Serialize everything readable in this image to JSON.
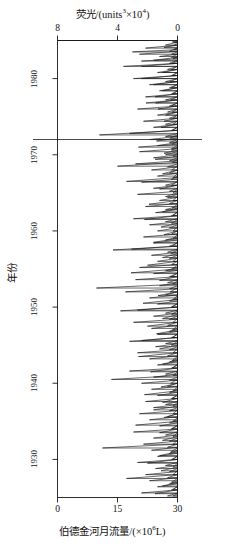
{
  "figure": {
    "kind": "dual-trace-time-series",
    "background_color": "#ffffff",
    "line_color": "#1a1a1a",
    "axis_color": "#1a1a1a"
  },
  "top_axis": {
    "title_main": "荧光/(units",
    "title_sup1": "3",
    "title_mid": "×10",
    "title_sup2": "4",
    "title_end": ")",
    "title_full": "荧光/(units³×10⁴)",
    "ticks": [
      "8",
      "4",
      "0"
    ],
    "range": [
      8,
      0
    ],
    "direction": "reversed"
  },
  "bottom_axis": {
    "title_main": "伯德金河月流量/(×10",
    "title_sup": "6",
    "title_end": "L)",
    "title_full": "伯德金河月流量/(×10⁶L)",
    "ticks": [
      "0",
      "15",
      "30"
    ],
    "range": [
      0,
      30
    ],
    "direction": "normal"
  },
  "y_axis": {
    "title": "年份",
    "ticks": [
      "1980",
      "1970",
      "1960",
      "1950",
      "1940",
      "1930"
    ],
    "range": [
      1985,
      1925
    ]
  },
  "annotations": {
    "marker_line_year": "1972"
  },
  "chart_data": {
    "type": "line",
    "xlabel": "伯德金河月流量/(×10⁶L)",
    "ylabel": "年份",
    "orientation": "horizontal-spikes-vertical-time",
    "grid": false,
    "legend": null,
    "ylim": [
      1925,
      1985
    ],
    "series": [
      {
        "name": "荧光",
        "axis": "top",
        "xlim": [
          8,
          0
        ],
        "baseline": 0,
        "units": "units³×10⁴",
        "points": [
          [
            1984.8,
            0.35
          ],
          [
            1984.4,
            0.2
          ],
          [
            1984.1,
            0.9
          ],
          [
            1983.8,
            0.25
          ],
          [
            1983.5,
            3.0
          ],
          [
            1983.2,
            0.4
          ],
          [
            1982.9,
            1.2
          ],
          [
            1982.6,
            0.3
          ],
          [
            1982.3,
            2.4
          ],
          [
            1982.0,
            0.35
          ],
          [
            1981.6,
            3.6
          ],
          [
            1981.2,
            0.4
          ],
          [
            1980.8,
            1.0
          ],
          [
            1980.4,
            0.3
          ],
          [
            1980.0,
            2.4
          ],
          [
            1979.6,
            0.5
          ],
          [
            1979.2,
            1.6
          ],
          [
            1978.8,
            0.4
          ],
          [
            1978.4,
            1.0
          ],
          [
            1978.0,
            0.3
          ],
          [
            1977.6,
            1.5
          ],
          [
            1977.2,
            0.45
          ],
          [
            1976.8,
            2.1
          ],
          [
            1976.4,
            0.4
          ],
          [
            1976.0,
            1.3
          ],
          [
            1975.6,
            0.35
          ],
          [
            1975.2,
            0.8
          ],
          [
            1974.8,
            0.3
          ],
          [
            1974.4,
            0.9
          ],
          [
            1974.0,
            0.3
          ],
          [
            1973.6,
            1.1
          ],
          [
            1973.2,
            0.35
          ],
          [
            1972.6,
            5.2
          ],
          [
            1972.2,
            0.5
          ],
          [
            1971.8,
            1.4
          ],
          [
            1971.4,
            0.35
          ],
          [
            1971.0,
            2.6
          ],
          [
            1970.6,
            0.4
          ],
          [
            1970.2,
            0.9
          ],
          [
            1969.8,
            0.3
          ],
          [
            1969.4,
            1.5
          ],
          [
            1969.0,
            0.35
          ],
          [
            1968.5,
            4.0
          ],
          [
            1968.0,
            0.4
          ],
          [
            1967.5,
            1.0
          ],
          [
            1967.0,
            0.3
          ],
          [
            1966.5,
            3.4
          ],
          [
            1966.0,
            0.4
          ],
          [
            1965.5,
            1.2
          ],
          [
            1965.0,
            0.3
          ],
          [
            1964.5,
            0.8
          ],
          [
            1964.0,
            0.3
          ],
          [
            1963.5,
            1.9
          ],
          [
            1963.0,
            0.35
          ],
          [
            1962.5,
            1.0
          ],
          [
            1962.0,
            0.3
          ],
          [
            1961.5,
            2.2
          ],
          [
            1961.0,
            0.4
          ],
          [
            1960.5,
            1.1
          ],
          [
            1960.0,
            0.3
          ],
          [
            1959.5,
            0.9
          ],
          [
            1959.0,
            0.3
          ],
          [
            1958.5,
            1.6
          ],
          [
            1958.0,
            0.35
          ],
          [
            1957.5,
            4.3
          ],
          [
            1957.0,
            0.45
          ],
          [
            1956.5,
            1.0
          ],
          [
            1956.0,
            0.3
          ],
          [
            1955.5,
            2.0
          ],
          [
            1955.0,
            0.35
          ],
          [
            1954.5,
            3.1
          ],
          [
            1954.0,
            0.4
          ],
          [
            1953.5,
            1.2
          ],
          [
            1953.0,
            0.3
          ],
          [
            1952.5,
            5.4
          ],
          [
            1952.0,
            0.5
          ],
          [
            1951.5,
            1.3
          ],
          [
            1951.0,
            0.3
          ],
          [
            1950.5,
            2.3
          ],
          [
            1950.0,
            0.4
          ],
          [
            1949.5,
            3.8
          ],
          [
            1949.0,
            0.4
          ],
          [
            1948.5,
            1.0
          ],
          [
            1948.0,
            0.3
          ],
          [
            1947.5,
            2.0
          ],
          [
            1947.0,
            0.35
          ],
          [
            1946.5,
            1.4
          ],
          [
            1946.0,
            0.3
          ],
          [
            1945.5,
            3.2
          ],
          [
            1945.0,
            0.4
          ],
          [
            1944.5,
            1.2
          ],
          [
            1944.0,
            0.3
          ],
          [
            1943.5,
            2.6
          ],
          [
            1943.0,
            0.35
          ],
          [
            1942.5,
            1.0
          ],
          [
            1942.0,
            0.3
          ],
          [
            1941.5,
            1.8
          ],
          [
            1941.0,
            0.3
          ],
          [
            1940.5,
            4.4
          ],
          [
            1940.0,
            0.45
          ],
          [
            1939.5,
            1.1
          ],
          [
            1939.0,
            0.3
          ],
          [
            1938.5,
            2.2
          ],
          [
            1938.0,
            0.35
          ],
          [
            1937.5,
            1.0
          ],
          [
            1937.0,
            0.3
          ],
          [
            1936.5,
            1.6
          ],
          [
            1936.0,
            0.3
          ],
          [
            1935.5,
            0.9
          ],
          [
            1935.0,
            0.3
          ],
          [
            1934.5,
            2.8
          ],
          [
            1934.0,
            0.4
          ],
          [
            1933.5,
            1.2
          ],
          [
            1933.0,
            0.3
          ],
          [
            1932.5,
            1.0
          ],
          [
            1932.0,
            0.3
          ],
          [
            1931.5,
            5.0
          ],
          [
            1931.0,
            0.45
          ],
          [
            1930.5,
            1.2
          ],
          [
            1930.0,
            0.3
          ],
          [
            1929.5,
            2.0
          ],
          [
            1929.0,
            0.3
          ],
          [
            1928.5,
            1.1
          ],
          [
            1928.0,
            0.3
          ],
          [
            1927.5,
            3.4
          ],
          [
            1927.0,
            0.4
          ],
          [
            1926.5,
            1.0
          ],
          [
            1926.0,
            0.3
          ],
          [
            1925.5,
            1.5
          ],
          [
            1925.2,
            0.3
          ]
        ]
      },
      {
        "name": "伯德金河月流量",
        "axis": "bottom",
        "xlim": [
          0,
          30
        ],
        "baseline": 30,
        "units": "×10⁶L",
        "points": [
          [
            1984.8,
            29.0
          ],
          [
            1984.4,
            27.0
          ],
          [
            1984.0,
            22.0
          ],
          [
            1983.6,
            28.0
          ],
          [
            1983.2,
            20.5
          ],
          [
            1982.8,
            28.5
          ],
          [
            1982.4,
            24.0
          ],
          [
            1982.0,
            28.0
          ],
          [
            1981.6,
            21.0
          ],
          [
            1981.2,
            27.5
          ],
          [
            1980.8,
            25.0
          ],
          [
            1980.4,
            28.5
          ],
          [
            1980.0,
            19.0
          ],
          [
            1979.6,
            27.0
          ],
          [
            1979.2,
            23.0
          ],
          [
            1978.8,
            28.0
          ],
          [
            1978.4,
            25.5
          ],
          [
            1978.0,
            28.5
          ],
          [
            1977.6,
            22.0
          ],
          [
            1977.2,
            27.0
          ],
          [
            1976.8,
            24.5
          ],
          [
            1976.4,
            28.0
          ],
          [
            1976.0,
            20.0
          ],
          [
            1975.6,
            27.5
          ],
          [
            1975.2,
            25.0
          ],
          [
            1974.8,
            28.0
          ],
          [
            1974.4,
            21.5
          ],
          [
            1974.0,
            27.0
          ],
          [
            1973.6,
            24.0
          ],
          [
            1973.2,
            28.5
          ],
          [
            1972.8,
            18.0
          ],
          [
            1972.4,
            27.0
          ],
          [
            1972.0,
            23.0
          ],
          [
            1971.6,
            28.0
          ],
          [
            1971.2,
            25.0
          ],
          [
            1970.8,
            28.5
          ],
          [
            1970.4,
            20.5
          ],
          [
            1970.0,
            27.0
          ],
          [
            1969.6,
            24.0
          ],
          [
            1969.2,
            28.0
          ],
          [
            1968.8,
            19.5
          ],
          [
            1968.4,
            27.5
          ],
          [
            1968.0,
            23.5
          ],
          [
            1967.6,
            28.0
          ],
          [
            1967.2,
            25.0
          ],
          [
            1966.8,
            28.5
          ],
          [
            1966.4,
            21.0
          ],
          [
            1966.0,
            27.0
          ],
          [
            1965.6,
            24.0
          ],
          [
            1965.2,
            28.0
          ],
          [
            1964.8,
            20.0
          ],
          [
            1964.4,
            27.5
          ],
          [
            1964.0,
            25.5
          ],
          [
            1963.6,
            28.0
          ],
          [
            1963.2,
            22.0
          ],
          [
            1962.8,
            27.0
          ],
          [
            1962.4,
            24.5
          ],
          [
            1962.0,
            28.5
          ],
          [
            1961.6,
            19.0
          ],
          [
            1961.2,
            27.0
          ],
          [
            1960.8,
            23.0
          ],
          [
            1960.4,
            28.0
          ],
          [
            1960.0,
            25.0
          ],
          [
            1959.6,
            28.5
          ],
          [
            1959.2,
            21.5
          ],
          [
            1958.8,
            27.0
          ],
          [
            1958.4,
            24.0
          ],
          [
            1958.0,
            28.0
          ],
          [
            1957.6,
            18.5
          ],
          [
            1957.2,
            27.5
          ],
          [
            1956.8,
            23.5
          ],
          [
            1956.4,
            28.0
          ],
          [
            1956.0,
            25.0
          ],
          [
            1955.6,
            28.5
          ],
          [
            1955.2,
            20.5
          ],
          [
            1954.8,
            27.0
          ],
          [
            1954.4,
            24.0
          ],
          [
            1954.0,
            28.0
          ],
          [
            1953.6,
            19.5
          ],
          [
            1953.2,
            27.5
          ],
          [
            1952.8,
            25.5
          ],
          [
            1952.4,
            28.0
          ],
          [
            1952.0,
            17.0
          ],
          [
            1951.6,
            27.0
          ],
          [
            1951.2,
            23.0
          ],
          [
            1950.8,
            28.0
          ],
          [
            1950.4,
            25.0
          ],
          [
            1950.0,
            28.5
          ],
          [
            1949.6,
            20.0
          ],
          [
            1949.2,
            27.0
          ],
          [
            1948.8,
            24.0
          ],
          [
            1948.4,
            28.0
          ],
          [
            1948.0,
            19.0
          ],
          [
            1947.6,
            27.5
          ],
          [
            1947.2,
            23.5
          ],
          [
            1946.8,
            28.0
          ],
          [
            1946.4,
            25.0
          ],
          [
            1946.0,
            28.5
          ],
          [
            1945.6,
            21.0
          ],
          [
            1945.2,
            27.0
          ],
          [
            1944.8,
            24.5
          ],
          [
            1944.4,
            28.0
          ],
          [
            1944.0,
            20.0
          ],
          [
            1943.6,
            27.5
          ],
          [
            1943.2,
            23.0
          ],
          [
            1942.8,
            28.0
          ],
          [
            1942.4,
            25.0
          ],
          [
            1942.0,
            28.5
          ],
          [
            1941.6,
            18.0
          ],
          [
            1941.2,
            27.0
          ],
          [
            1940.8,
            24.0
          ],
          [
            1940.4,
            28.0
          ],
          [
            1940.0,
            21.0
          ],
          [
            1939.6,
            27.5
          ],
          [
            1939.2,
            23.5
          ],
          [
            1938.8,
            28.0
          ],
          [
            1938.4,
            25.0
          ],
          [
            1938.0,
            28.5
          ],
          [
            1937.6,
            22.0
          ],
          [
            1937.2,
            27.0
          ],
          [
            1936.8,
            24.0
          ],
          [
            1936.4,
            28.0
          ],
          [
            1936.0,
            20.5
          ],
          [
            1935.6,
            27.5
          ],
          [
            1935.2,
            23.0
          ],
          [
            1934.8,
            28.0
          ],
          [
            1934.4,
            25.5
          ],
          [
            1934.0,
            28.5
          ],
          [
            1933.6,
            19.0
          ],
          [
            1933.2,
            27.0
          ],
          [
            1932.8,
            24.0
          ],
          [
            1932.4,
            28.0
          ],
          [
            1932.0,
            21.5
          ],
          [
            1931.6,
            27.5
          ],
          [
            1931.2,
            23.5
          ],
          [
            1930.8,
            28.0
          ],
          [
            1930.4,
            25.0
          ],
          [
            1930.0,
            28.5
          ],
          [
            1929.6,
            20.0
          ],
          [
            1929.2,
            27.0
          ],
          [
            1928.8,
            24.5
          ],
          [
            1928.4,
            28.0
          ],
          [
            1928.0,
            22.0
          ],
          [
            1927.6,
            27.5
          ],
          [
            1927.2,
            23.0
          ],
          [
            1926.8,
            28.0
          ],
          [
            1926.4,
            25.0
          ],
          [
            1926.0,
            28.5
          ],
          [
            1925.6,
            21.0
          ],
          [
            1925.2,
            27.5
          ]
        ]
      }
    ]
  }
}
